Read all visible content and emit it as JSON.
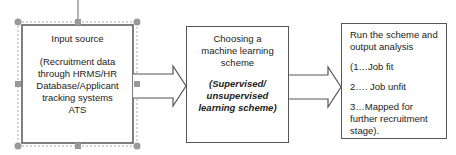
{
  "diagram": {
    "boxes": [
      {
        "title": "Input source",
        "lines": [
          "(Recruitment data",
          "through HRMS/HR",
          "Database/Applicant",
          "tracking systems",
          "ATS"
        ]
      },
      {
        "title_lines": [
          "Choosing a",
          "machine learning",
          "scheme"
        ],
        "italic_lines": [
          "(Supervised/",
          "unsupervised",
          "learning scheme)"
        ]
      },
      {
        "title_lines": [
          "Run the scheme and",
          "output analysis"
        ],
        "items": [
          "(1…Job fit",
          "2…. Job unfit"
        ],
        "last_item_lines": [
          "3…Mapped for",
          "further recruitment",
          "stage)."
        ]
      }
    ],
    "connectors": [
      {
        "from": "Input source",
        "to": "Choosing a machine learning scheme",
        "style": "block-arrow"
      },
      {
        "from": "Choosing a machine learning scheme",
        "to": "Run the scheme and output analysis",
        "style": "block-arrow"
      }
    ],
    "colors": {
      "stroke": "#555555",
      "handle": "#999999",
      "selection": "#aaaaaa"
    }
  }
}
